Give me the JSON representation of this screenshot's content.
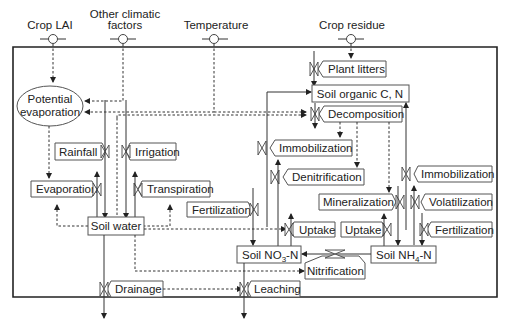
{
  "diagram": {
    "inputs": {
      "crop_lai": "Crop LAI",
      "other_climatic_line1": "Other climatic",
      "other_climatic_line2": "factors",
      "temperature": "Temperature",
      "crop_residue": "Crop residue"
    },
    "pools": {
      "potential_evap_line1": "Potential",
      "potential_evap_line2": "evaporation",
      "soil_water": "Soil water",
      "soil_organic": "Soil organic C, N",
      "soil_no3": "Soil NO",
      "soil_no3_sub": "3",
      "soil_no3_suffix": "-N",
      "soil_nh4": "Soil NH",
      "soil_nh4_sub": "4",
      "soil_nh4_suffix": "-N"
    },
    "processes": {
      "plant_litters": "Plant litters",
      "decomposition": "Decomposition",
      "immobilization_1": "Immobilization",
      "denitrification": "Denitrification",
      "immobilization_2": "Immobilization",
      "mineralization": "Mineralization",
      "volatilization": "Volatilization",
      "rainfall": "Rainfall",
      "irrigation": "Irrigation",
      "evaporation": "Evaporation",
      "transpiration": "Transpiration",
      "fertilization_no3": "Fertilization",
      "uptake_no3": "Uptake",
      "uptake_nh4": "Uptake",
      "fertilization_nh4": "Fertilization",
      "nitrification": "Nitrification",
      "drainage": "Drainage",
      "leaching": "Leaching"
    }
  }
}
